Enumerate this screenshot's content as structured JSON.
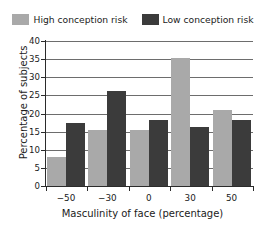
{
  "chart_data": {
    "type": "bar",
    "title": "",
    "xlabel": "Masculinity of face (percentage)",
    "ylabel": "Percentage of subjects",
    "categories": [
      "−50",
      "−30",
      "0",
      "30",
      "50"
    ],
    "series": [
      {
        "name": "High conception risk",
        "color": "#a9a9a9",
        "values": [
          8.0,
          15.5,
          15.5,
          35.3,
          21.0
        ]
      },
      {
        "name": "Low conception risk",
        "color": "#3b3b3b",
        "values": [
          17.5,
          26.2,
          18.3,
          16.2,
          18.2
        ]
      }
    ],
    "ylim": [
      0,
      40
    ],
    "ytick_labels": [
      "0",
      "5",
      "10",
      "15",
      "20",
      "25",
      "30",
      "35",
      "40"
    ],
    "ytick_values": [
      0,
      5,
      10,
      15,
      20,
      25,
      30,
      35,
      40
    ],
    "grid": true,
    "legend_position": "top"
  },
  "legend": {
    "entries": [
      {
        "label": "High conception risk",
        "swatch": "legend-swatch-high"
      },
      {
        "label": "Low conception risk",
        "swatch": "legend-swatch-low"
      }
    ]
  }
}
